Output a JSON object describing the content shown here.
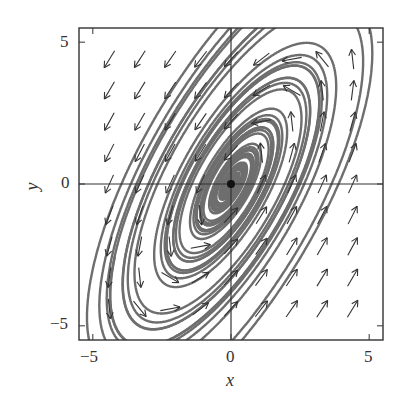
{
  "chart_data": {
    "type": "phase-portrait",
    "title": "",
    "xlabel": "x",
    "ylabel": "y",
    "xlim": [
      -5.5,
      5.5
    ],
    "ylim": [
      -5.5,
      5.5
    ],
    "xticks": [
      -5,
      0,
      5
    ],
    "yticks": [
      -5,
      0,
      5
    ],
    "xtick_labels": [
      "−5",
      "0",
      "5"
    ],
    "ytick_labels": [
      "−5",
      "0",
      "5"
    ],
    "grid": false,
    "zero_lines": true,
    "equilibrium": {
      "x": 0,
      "y": 0,
      "type": "stable spiral"
    },
    "vector_field": {
      "system": "dx/dt = 1.8x - 2y, dy/dt = 4x - 2.2y",
      "arrow_grid_spacing": 1.1,
      "description": "Arrows point down-left in upper-left region, up-right in lower-right region; counterclockwise rotation spiraling into origin"
    },
    "trajectories_description": "Gray solid curves spiraling counterclockwise into the origin",
    "colors": {
      "curves": "#6e6e6e",
      "arrows": "#333333",
      "axes": "#333333",
      "equilibrium": "#111111"
    }
  },
  "axes": {
    "x_label": "x",
    "y_label": "y",
    "x_ticks": [
      "−5",
      "0",
      "5"
    ],
    "y_ticks": [
      "5",
      "0",
      "−5"
    ]
  }
}
